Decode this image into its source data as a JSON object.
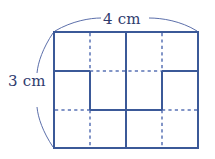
{
  "figure": {
    "colors": {
      "line": "#3b5998",
      "dashed": "#5a73b5",
      "brace": "#4a5fa0",
      "text": "#2f3c6e",
      "background": "#ffffff"
    },
    "rectangle": {
      "x": 54,
      "y": 32,
      "width": 144,
      "height": 116,
      "columns": 4,
      "rows": 3
    },
    "dimensions": {
      "width_label": "4 cm",
      "width_value": 4,
      "height_label": "3 cm",
      "height_value": 3,
      "unit": "cm"
    },
    "grid": {
      "vertical_x": [
        90,
        126,
        162
      ],
      "horizontal_y": [
        71,
        110
      ],
      "top_band_verticals": [
        "dashed",
        "solid",
        "dashed"
      ],
      "middle_band_verticals": [
        "solid",
        "solid",
        "solid"
      ],
      "bottom_band_verticals": [
        "dashed",
        "solid",
        "dashed"
      ],
      "upper_horizontal_segments": [
        "solid",
        "dashed",
        "dashed",
        "solid"
      ],
      "lower_horizontal_segments": [
        "dashed",
        "solid",
        "solid",
        "dashed"
      ]
    },
    "braces": {
      "top": "width-brace",
      "left": "height-brace"
    }
  }
}
